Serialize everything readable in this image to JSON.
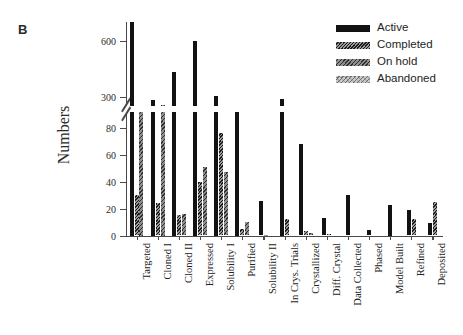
{
  "panel": {
    "letter": "B"
  },
  "chart_data": {
    "type": "bar",
    "title": "",
    "xlabel": "",
    "ylabel": "Numbers",
    "grid": false,
    "legend_position": "top-right",
    "broken_axis": true,
    "axis_note": "y-axis is broken: lower band 0-90, upper band ~250-700",
    "lower_ticks": [
      0,
      20,
      40,
      60,
      80
    ],
    "upper_ticks": [
      300,
      600
    ],
    "lower_ylim": [
      0,
      92
    ],
    "upper_ylim": [
      250,
      700
    ],
    "categories": [
      "Targeted",
      "Cloned I",
      "Cloned II",
      "Expressed",
      "Solubility I",
      "Purified",
      "Solubility II",
      "In Crys. Trials",
      "Crystallized",
      "Diff. Crystal",
      "Data Collected",
      "Phased",
      "Model Built",
      "Refined",
      "Deposited"
    ],
    "series": [
      {
        "name": "Active",
        "color": "#121212",
        "pattern": "solid",
        "values": [
          700,
          283,
          430,
          597,
          303,
          250,
          26,
          288,
          68,
          13,
          30,
          4,
          23,
          19,
          9
        ]
      },
      {
        "name": "Completed",
        "color": "#9a9a9a",
        "pattern": "dense-hatch",
        "values": [
          30,
          24,
          15,
          40,
          76,
          5,
          0.5,
          12,
          3,
          0.8,
          0,
          0,
          0,
          12,
          25
        ]
      },
      {
        "name": "On hold",
        "color": "#8e8e8e",
        "pattern": "diagonal-hatch",
        "values": [
          92,
          255,
          16,
          51,
          47,
          10,
          0,
          0,
          1.5,
          0,
          0,
          0,
          0,
          0,
          0
        ]
      },
      {
        "name": "Abandoned",
        "color": "#c9c9c9",
        "pattern": "light-dotted",
        "values": [
          0,
          0,
          0,
          0,
          0,
          0,
          0,
          0,
          0,
          0,
          0,
          0,
          0,
          0,
          0
        ]
      }
    ]
  },
  "legend": {
    "items": [
      {
        "label": "Active",
        "pattern": "solid"
      },
      {
        "label": "Completed",
        "pattern": "dense-hatch"
      },
      {
        "label": "On hold",
        "pattern": "diagonal-hatch"
      },
      {
        "label": "Abandoned",
        "pattern": "light-dotted"
      }
    ]
  }
}
